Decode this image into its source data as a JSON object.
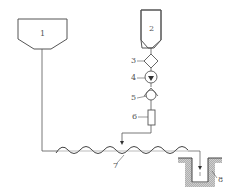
{
  "diagram": {
    "type": "process-flow-schematic",
    "labels": {
      "hopper_1": "1",
      "hopper_2": "2",
      "component_3": "3",
      "component_4": "4",
      "component_5": "5",
      "component_6": "6",
      "screw_7": "7",
      "pit_8": "8"
    },
    "colors": {
      "line": "#555555",
      "hatch": "#aaaaaa",
      "background": "#ffffff"
    }
  }
}
